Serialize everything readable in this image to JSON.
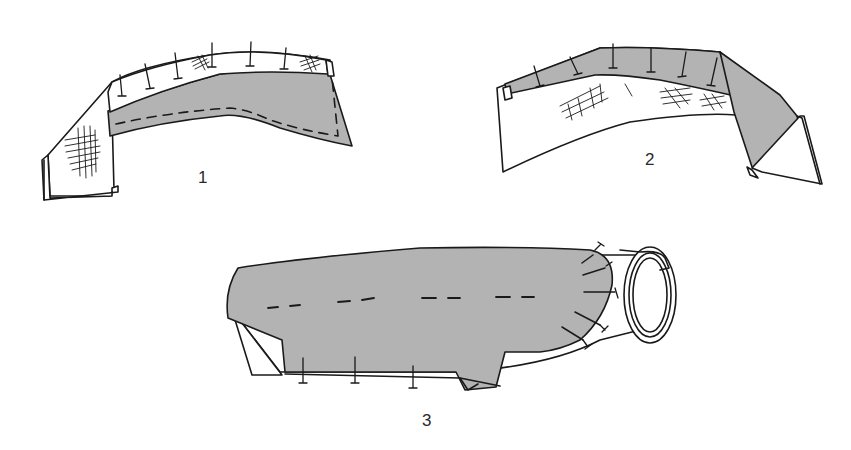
{
  "diagram": {
    "type": "sewing-instruction-illustration",
    "colors": {
      "line": "#1a1a1a",
      "fill_gray": "#b3b3b3",
      "background": "#ffffff"
    },
    "figures": [
      {
        "id": "1",
        "label": "1",
        "description": "Collar with pinned interfacing/facing strip, gray band with dashed stitching line"
      },
      {
        "id": "2",
        "label": "2",
        "description": "Collar reverse view with gray band along top edge, pins and crosshatched padding"
      },
      {
        "id": "3",
        "label": "3",
        "description": "Sleeve with gray lining pinned along seams and around cuff opening"
      }
    ]
  }
}
